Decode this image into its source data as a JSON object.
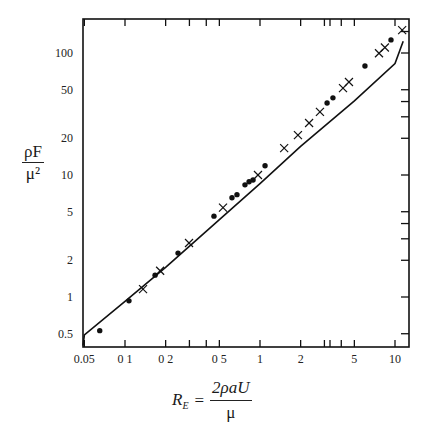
{
  "chart_data": {
    "type": "scatter",
    "title": "",
    "xlabel": "R_E = 2ρaU/μ",
    "ylabel": "ρF/μ²",
    "xscale": "log",
    "yscale": "log",
    "xlim": [
      0.04,
      12
    ],
    "ylim": [
      0.4,
      190
    ],
    "grid": false,
    "legend": null,
    "x_ticks": [
      0.05,
      0.1,
      0.2,
      0.5,
      1,
      2,
      5,
      10
    ],
    "x_tick_labels": [
      "0.05",
      "0 1",
      "0 2",
      "0 5",
      "1",
      "2",
      "5",
      "10"
    ],
    "x_minor_ticks": [
      0.3,
      0.4,
      3,
      4,
      3.3
    ],
    "y_ticks": [
      0.5,
      1,
      2,
      5,
      10,
      20,
      50,
      100
    ],
    "y_tick_labels": [
      "0.5",
      "1",
      "2",
      "5",
      "10",
      "20",
      "50",
      "100"
    ],
    "series": [
      {
        "name": "dots",
        "marker": "filled-circle",
        "x": [
          0.065,
          0.107,
          0.167,
          0.247,
          0.456,
          0.62,
          0.675,
          0.774,
          0.83,
          0.888,
          1.09,
          3.14,
          3.47,
          5.99,
          9.34
        ],
        "y": [
          0.53,
          0.93,
          1.51,
          2.29,
          4.6,
          6.5,
          6.9,
          8.3,
          8.8,
          9.1,
          11.9,
          38.9,
          42.9,
          78.3,
          128
        ]
      },
      {
        "name": "crosses",
        "marker": "x",
        "x": [
          0.136,
          0.182,
          0.298,
          0.532,
          0.966,
          1.51,
          1.91,
          2.31,
          2.78,
          4.12,
          4.56,
          7.61,
          8.42,
          11.3
        ],
        "y": [
          1.16,
          1.64,
          2.77,
          5.4,
          10.0,
          16.6,
          21.2,
          26.7,
          32.9,
          51.5,
          57.8,
          99.6,
          111,
          154
        ]
      },
      {
        "name": "theory",
        "marker": "line",
        "x": [
          0.04,
          0.05,
          0.1,
          0.2,
          0.5,
          1,
          2,
          5,
          10,
          11.5
        ],
        "y": [
          0.4,
          0.49,
          0.92,
          1.75,
          4.3,
          8.5,
          17.2,
          40.5,
          82,
          125
        ]
      }
    ]
  },
  "labels": {
    "y_num": "ρF",
    "y_den": "μ²",
    "x_lhs": "R",
    "x_sub": "E",
    "x_eq": "=",
    "x_num": "2ρaU",
    "x_den": "μ"
  }
}
